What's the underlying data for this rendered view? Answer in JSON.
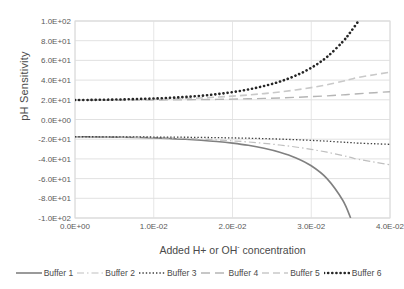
{
  "chart_data": {
    "type": "line",
    "title": "",
    "xlabel": "Added H+ or OH- concentration",
    "xlabel_main": "Added H+ or OH",
    "xlabel_sup": "-",
    "xlabel_tail": " concentration",
    "ylabel": "pH Sensitivity",
    "xlim": [
      0,
      0.04
    ],
    "ylim": [
      -100,
      100
    ],
    "grid": true,
    "legend_position": "bottom",
    "xticks": [
      "0.0E+00",
      "1.0E-02",
      "2.0E-02",
      "3.0E-02",
      "4.0E-02"
    ],
    "xtick_values": [
      0,
      0.01,
      0.02,
      0.03,
      0.04
    ],
    "yticks": [
      "1.0E+02",
      "8.0E+01",
      "6.0E+01",
      "4.0E+01",
      "2.0E+01",
      "0.0E+00",
      "-2.0E+01",
      "-4.0E+01",
      "-6.0E+01",
      "-8.0E+01",
      "-1.0E+02"
    ],
    "ytick_values": [
      100,
      80,
      60,
      40,
      20,
      0,
      -20,
      -40,
      -60,
      -80,
      -100
    ],
    "x": [
      0,
      0.002,
      0.004,
      0.006,
      0.008,
      0.01,
      0.012,
      0.014,
      0.016,
      0.018,
      0.02,
      0.022,
      0.024,
      0.026,
      0.028,
      0.03,
      0.032,
      0.034,
      0.035,
      0.036,
      0.038,
      0.04
    ],
    "series": [
      {
        "name": "Buffer 1",
        "style": "solid",
        "color": "#808080",
        "width": 1.6,
        "values": [
          -17.5,
          -17.6,
          -17.8,
          -18.0,
          -18.3,
          -18.7,
          -19.3,
          -20.0,
          -21.0,
          -22.3,
          -24.0,
          -26.2,
          -29.2,
          -33.2,
          -38.8,
          -47.0,
          -60.0,
          -82.0,
          -100.0,
          null,
          null,
          null
        ]
      },
      {
        "name": "Buffer 2",
        "style": "dashdot",
        "color": "#bfbfbf",
        "width": 1.2,
        "values": [
          -17.5,
          -17.6,
          -17.7,
          -17.9,
          -18.1,
          -18.4,
          -18.8,
          -19.3,
          -19.9,
          -20.7,
          -21.7,
          -22.8,
          -24.2,
          -25.9,
          -27.9,
          -30.3,
          -33.2,
          -36.6,
          -38.5,
          -40.5,
          -43.2,
          -46.0
        ]
      },
      {
        "name": "Buffer 3",
        "style": "dotted",
        "color": "#3f3f3f",
        "width": 1.3,
        "values": [
          -17.5,
          -17.5,
          -17.6,
          -17.6,
          -17.7,
          -17.8,
          -17.9,
          -18.0,
          -18.2,
          -18.4,
          -18.7,
          -19.0,
          -19.4,
          -19.9,
          -20.5,
          -21.2,
          -22.0,
          -23.0,
          -23.5,
          -24.0,
          -24.6,
          -25.2
        ]
      },
      {
        "name": "Buffer 4",
        "style": "longdash",
        "color": "#b5b5b5",
        "width": 1.4,
        "values": [
          19.5,
          19.5,
          19.6,
          19.6,
          19.7,
          19.8,
          19.9,
          20.0,
          20.2,
          20.4,
          20.7,
          21.0,
          21.4,
          21.9,
          22.5,
          23.2,
          24.0,
          25.0,
          25.6,
          26.2,
          27.2,
          28.2
        ]
      },
      {
        "name": "Buffer 5",
        "style": "dashed",
        "color": "#c9c9c9",
        "width": 1.6,
        "values": [
          19.5,
          19.6,
          19.7,
          19.9,
          20.1,
          20.4,
          20.8,
          21.3,
          21.9,
          22.7,
          23.7,
          24.9,
          26.3,
          28.0,
          30.0,
          32.4,
          35.3,
          38.8,
          40.8,
          42.8,
          45.5,
          48.0
        ]
      },
      {
        "name": "Buffer 6",
        "style": "thickdot",
        "color": "#262626",
        "width": 2.6,
        "values": [
          19.8,
          19.9,
          20.1,
          20.4,
          20.8,
          21.3,
          22.0,
          22.9,
          24.1,
          25.7,
          27.8,
          30.5,
          34.0,
          38.5,
          44.5,
          52.5,
          63.5,
          79.0,
          89.0,
          100.0,
          null,
          null
        ]
      }
    ]
  },
  "legend": {
    "items": [
      {
        "label": "Buffer 1"
      },
      {
        "label": "Buffer 2"
      },
      {
        "label": "Buffer 3"
      },
      {
        "label": "Buffer 4"
      },
      {
        "label": "Buffer 5"
      },
      {
        "label": "Buffer 6"
      }
    ]
  }
}
